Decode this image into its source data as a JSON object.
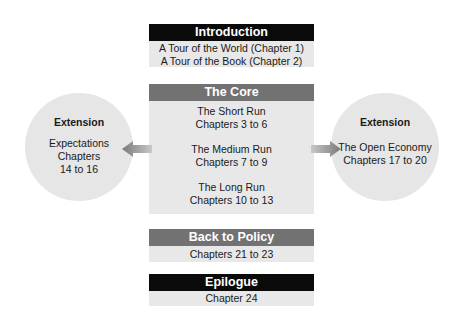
{
  "introduction": {
    "title": "Introduction",
    "lines": [
      "A Tour of the World (Chapter 1)",
      "A Tour of the Book (Chapter 2)"
    ]
  },
  "core": {
    "title": "The Core",
    "sections": [
      {
        "name": "The Short Run",
        "chapters": "Chapters 3 to 6"
      },
      {
        "name": "The Medium Run",
        "chapters": "Chapters 7 to 9"
      },
      {
        "name": "The Long Run",
        "chapters": "Chapters 10 to 13"
      }
    ]
  },
  "policy": {
    "title": "Back to Policy",
    "chapters": "Chapters 21 to 23"
  },
  "epilogue": {
    "title": "Epilogue",
    "chapters": "Chapter 24"
  },
  "extension_left": {
    "title": "Extension",
    "lines": [
      "Expectations",
      "Chapters",
      "14 to 16"
    ]
  },
  "extension_right": {
    "title": "Extension",
    "lines": [
      "The Open Economy",
      "Chapters 17 to 20"
    ]
  },
  "colors": {
    "dark_header": "#0a0a0a",
    "mid_header": "#727272",
    "box_fill": "#e8e8e8",
    "circle_fill": "#e6e6e6"
  }
}
